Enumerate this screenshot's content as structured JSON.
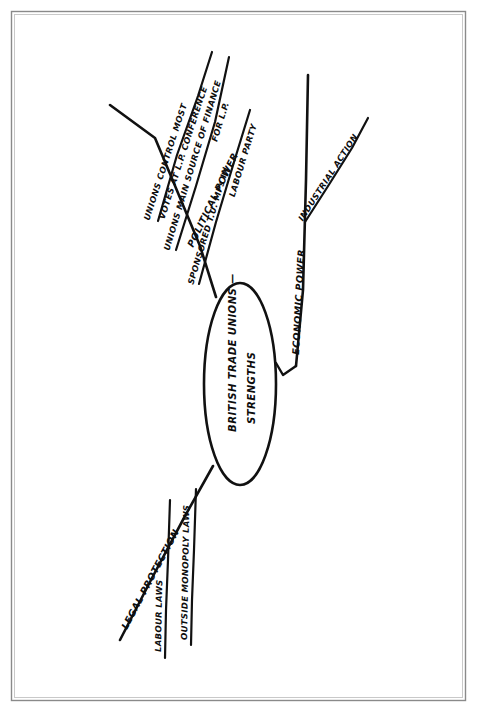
{
  "document": {
    "title": "British Trade Unions - Strengths Mind Map",
    "background_color": "#ffffff",
    "ink_color": "#111111",
    "frame_color": "#8a8a8a"
  },
  "center": {
    "name": "central-topic",
    "line1": "BRITISH TRADE UNIONS —",
    "line2": "STRENGTHS",
    "full_text": "BRITISH TRADE UNIONS — STRENGTHS"
  },
  "branches": [
    {
      "id": "political-power",
      "label": "POLITICAL POWER",
      "children": [
        {
          "id": "lp-conference-votes",
          "line1": "UNIONS CONTROL MOST",
          "line2": "VOTES AT L.P. CONFERENCE"
        },
        {
          "id": "lp-finance",
          "line1": "UNIONS MAIN SOURCE OF FINANCE",
          "line2": "FOR L.P."
        },
        {
          "id": "sponsored-mps",
          "line1": "SPONSORED T.U. MPs IN",
          "line2": "LABOUR PARTY"
        }
      ]
    },
    {
      "id": "economic-power",
      "label": "ECONOMIC POWER",
      "children": [
        {
          "id": "industrial-action",
          "line1": "INDUSTRIAL ACTION",
          "line2": ""
        }
      ]
    },
    {
      "id": "legal-protection",
      "label": "LEGAL PROTECTION",
      "children": [
        {
          "id": "labour-laws",
          "line1": "LABOUR LAWS",
          "line2": ""
        },
        {
          "id": "outside-monopoly-laws",
          "line1": "OUTSIDE MONOPOLY LAWS",
          "line2": ""
        }
      ]
    }
  ]
}
